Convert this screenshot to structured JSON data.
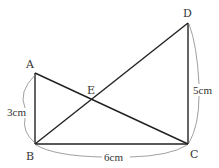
{
  "diagram": {
    "type": "geometry",
    "points": {
      "A": {
        "label": "A",
        "x": 35,
        "y": 73
      },
      "B": {
        "label": "B",
        "x": 35,
        "y": 144
      },
      "C": {
        "label": "C",
        "x": 188,
        "y": 144
      },
      "D": {
        "label": "D",
        "x": 188,
        "y": 23
      },
      "E": {
        "label": "E"
      }
    },
    "segments": [
      "AB",
      "BC",
      "CD",
      "AC",
      "BD"
    ],
    "measurements": {
      "AB": "3cm",
      "BC": "6cm",
      "CD": "5cm"
    },
    "colors": {
      "line": "#222222",
      "brace": "#888888",
      "text": "#333333"
    }
  }
}
